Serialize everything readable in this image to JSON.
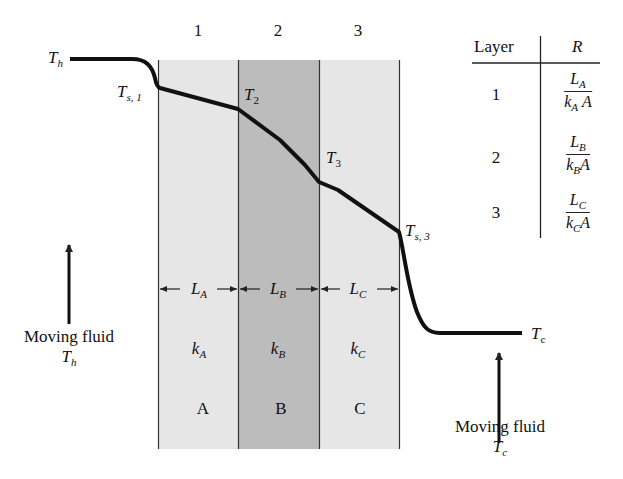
{
  "diagram": {
    "colors": {
      "layer_A": "#e6e6e6",
      "layer_B": "#bcbcbc",
      "layer_C": "#e6e6e6",
      "curve": "#111111",
      "lines": "#333333"
    },
    "layer_numbers": [
      "1",
      "2",
      "3"
    ],
    "layers": [
      {
        "id": "A",
        "letter": "A",
        "thickness_sym": "L",
        "thickness_sub": "A",
        "conductivity_sym": "k",
        "conductivity_sub": "A"
      },
      {
        "id": "B",
        "letter": "B",
        "thickness_sym": "L",
        "thickness_sub": "B",
        "conductivity_sym": "k",
        "conductivity_sub": "B"
      },
      {
        "id": "C",
        "letter": "C",
        "thickness_sym": "L",
        "thickness_sub": "C",
        "conductivity_sym": "k",
        "conductivity_sub": "C"
      }
    ],
    "temperatures": {
      "hot": {
        "sym": "T",
        "sub": "h"
      },
      "surface1": {
        "sym": "T",
        "sub": "s, 1"
      },
      "t2": {
        "sym": "T",
        "sub": "2"
      },
      "t3": {
        "sym": "T",
        "sub": "3"
      },
      "surface3": {
        "sym": "T",
        "sub": "s, 3"
      },
      "cold": {
        "sym": "T",
        "sub": "c"
      }
    },
    "left_fluid": {
      "label": "Moving fluid",
      "temp_sym": "T",
      "temp_sub": "h"
    },
    "right_fluid": {
      "label": "Moving fluid",
      "temp_sym": "T",
      "temp_sub": "c"
    },
    "table": {
      "headers": [
        "Layer",
        "R"
      ],
      "rows": [
        {
          "layer": "1",
          "num": "L",
          "num_sub": "A",
          "den": "k",
          "den_sub": "A",
          "den_tail": "A"
        },
        {
          "layer": "2",
          "num": "L",
          "num_sub": "B",
          "den": "k",
          "den_sub": "B",
          "den_tail": "A"
        },
        {
          "layer": "3",
          "num": "L",
          "num_sub": "C",
          "den": "k",
          "den_sub": "C",
          "den_tail": "A"
        }
      ]
    }
  }
}
